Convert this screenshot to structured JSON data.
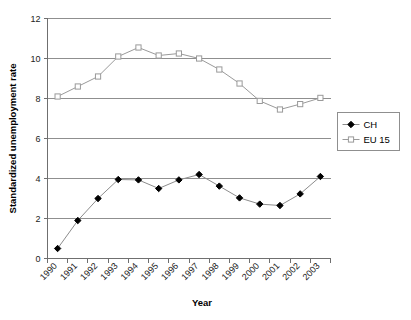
{
  "chart_data": {
    "type": "line",
    "title": "",
    "xlabel": "Year",
    "ylabel": "Standardized unemployment rate",
    "categories": [
      "1990",
      "1991",
      "1992",
      "1993",
      "1994",
      "1995",
      "1996",
      "1997",
      "1998",
      "1999",
      "2000",
      "2001",
      "2002",
      "2003"
    ],
    "xlim": [
      0,
      14
    ],
    "ylim": [
      0,
      12
    ],
    "yticks": [
      0,
      2,
      4,
      6,
      8,
      10,
      12
    ],
    "ytick_labels": [
      "0",
      "2",
      "4",
      "6",
      "8",
      "10",
      "12"
    ],
    "grid": "horizontal",
    "legend_position": "right",
    "series": [
      {
        "name": "CH",
        "marker": "filled-diamond",
        "color": "#000000",
        "line_color": "#8c8c8c",
        "values": [
          0.5,
          1.9,
          3.0,
          3.95,
          3.93,
          3.5,
          3.93,
          4.2,
          3.62,
          3.03,
          2.72,
          2.65,
          3.23,
          4.1
        ]
      },
      {
        "name": "EU 15",
        "marker": "open-square",
        "color": "#9a9a9a",
        "line_color": "#9a9a9a",
        "values": [
          8.1,
          8.6,
          9.1,
          10.1,
          10.55,
          10.15,
          10.25,
          10.0,
          9.45,
          8.75,
          7.88,
          7.45,
          7.72,
          8.03
        ]
      }
    ]
  },
  "legend": {
    "items": [
      {
        "label": "CH"
      },
      {
        "label": "EU 15"
      }
    ]
  },
  "colors": {
    "axis": "#6f6f6f",
    "gridline": "#8f8f8f",
    "ch_line": "#8c8c8c",
    "ch_marker": "#000000",
    "eu_line": "#9a9a9a",
    "eu_marker": "#9a9a9a",
    "legend_border": "#8f8f8f",
    "background": "#ffffff"
  }
}
